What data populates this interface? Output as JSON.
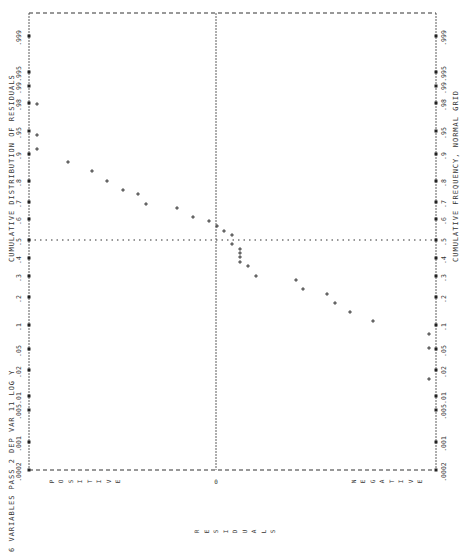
{
  "header": {
    "run_label": "6 VARIABLES PASS 2  DEP VAR 11 LOG Y",
    "title": "CUMULATIVE DISTRIBUTION OF RESIDUALS"
  },
  "footer": {
    "axis_title": "CUMULATIVE FREQUENCY, NORMAL GRID"
  },
  "residual_axis": {
    "positive_label": "POSITIVE",
    "zero_label": "0",
    "negative_label": "NEGATIVE",
    "title": "RESIDUALS"
  },
  "chart_data": {
    "type": "scatter",
    "title": "CUMULATIVE DISTRIBUTION OF RESIDUALS",
    "subtitle": "6 VARIABLES PASS 2  DEP VAR 11 LOG Y",
    "xlabel": "RESIDUALS (POSITIVE ... 0 ... NEGATIVE)",
    "ylabel": "CUMULATIVE FREQUENCY, NORMAL GRID",
    "orientation_note": "page rotated 90 degrees; frequency runs top (.999) to bottom (.0002)",
    "frequency_ticks": [
      ".999",
      ".995",
      ".99",
      ".98",
      ".95",
      ".9",
      ".8",
      ".7",
      ".6",
      ".5",
      ".4",
      ".3",
      ".2",
      ".1",
      ".05",
      ".02",
      ".01",
      ".005",
      ".001",
      ".0002"
    ],
    "frequency_tick_y": [
      36,
      72,
      86,
      103,
      131,
      154,
      181,
      202,
      219,
      240,
      258,
      276,
      297,
      325,
      349,
      370,
      396,
      410,
      442,
      470
    ],
    "reference_lines": {
      "zero_residual_x": 216,
      "median_frequency_y": 240
    },
    "grid": false,
    "points_px": [
      [
        37,
        104
      ],
      [
        37,
        135
      ],
      [
        37,
        149
      ],
      [
        68,
        162
      ],
      [
        92,
        171
      ],
      [
        107,
        181
      ],
      [
        123,
        190
      ],
      [
        138,
        194
      ],
      [
        146,
        204
      ],
      [
        177,
        208
      ],
      [
        193,
        217
      ],
      [
        209,
        221
      ],
      [
        217,
        226
      ],
      [
        224,
        231
      ],
      [
        232,
        235
      ],
      [
        232,
        244
      ],
      [
        240,
        249
      ],
      [
        240,
        253
      ],
      [
        240,
        257
      ],
      [
        240,
        262
      ],
      [
        248,
        266
      ],
      [
        256,
        276
      ],
      [
        296,
        280
      ],
      [
        303,
        289
      ],
      [
        327,
        294
      ],
      [
        335,
        303
      ],
      [
        350,
        312
      ],
      [
        373,
        321
      ],
      [
        429,
        334
      ],
      [
        429,
        348
      ],
      [
        429,
        379
      ]
    ]
  }
}
